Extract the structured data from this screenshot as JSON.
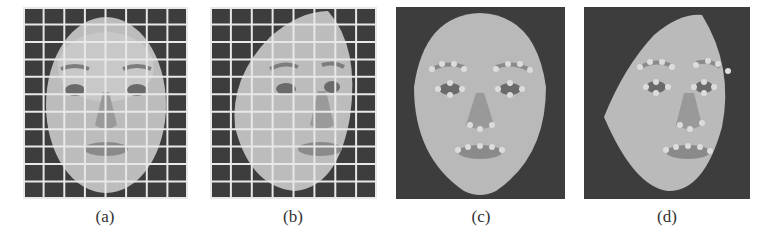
{
  "figure": {
    "panels": [
      {
        "id": "a",
        "label": "(a)",
        "description": "Frontal face image overlaid with a regular white grid",
        "grid": {
          "cols": 8,
          "rows": 11
        }
      },
      {
        "id": "b",
        "label": "(b)",
        "description": "Face image warped / rotated with the same white grid overlay",
        "grid": {
          "cols": 8,
          "rows": 11
        }
      },
      {
        "id": "c",
        "label": "(c)",
        "description": "Frontal face with facial feature landmark points on brows, eyes, nose and mouth"
      },
      {
        "id": "d",
        "label": "(d)",
        "description": "Rotated face with facial feature landmark points on brows, eyes, nose and mouth"
      }
    ],
    "colors": {
      "background": "#3d3d3d",
      "face": "#bdbdbd",
      "grid_line": "#e8e8e8",
      "landmark": "#dcdcdc",
      "caption": "#333333"
    }
  }
}
